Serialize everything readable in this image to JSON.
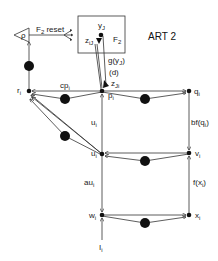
{
  "title": "ART 2",
  "f2_box": {
    "label": "F",
    "label_sub": "2",
    "y_label": "y",
    "y_sub": "J",
    "z_label": "z",
    "z_sub": "iJ"
  },
  "reset": {
    "symbol": "ρ",
    "label": "F",
    "label_sub": "2",
    "label_suffix": " reset"
  },
  "nodes": {
    "r": {
      "label": "r",
      "sub": "i"
    },
    "p": {
      "label": "p",
      "sub": "i"
    },
    "q": {
      "label": "q",
      "sub": "i"
    },
    "u": {
      "label": "u",
      "sub": "i"
    },
    "v": {
      "label": "v",
      "sub": "i"
    },
    "w": {
      "label": "w",
      "sub": "i"
    },
    "x": {
      "label": "x",
      "sub": "i"
    },
    "I": {
      "label": "I",
      "sub": "i"
    }
  },
  "edge_labels": {
    "gy": "g(y",
    "gy_sub": "J",
    "gy_close": ")",
    "d": "(d)",
    "zJi": "z",
    "zJi_sub": "Ji",
    "cp": "cp",
    "cp_sub": "i",
    "u_edge": "u",
    "u_edge_sub": "i",
    "au": "au",
    "au_sub": "i",
    "bfq": "bf(q",
    "bfq_sub": "i",
    "bfq_close": ")",
    "fx": "f(x",
    "fx_sub": "i",
    "fx_close": ")"
  }
}
